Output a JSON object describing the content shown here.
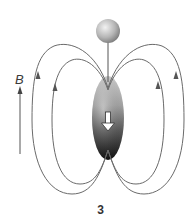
{
  "diagram": {
    "field_label": "B",
    "figure_number": "3",
    "elements": {
      "sphere": "charged-sphere",
      "stick": "rod",
      "ellipsoid": "magnetized-body",
      "moment_arrow": "downward-white-arrow",
      "field_lines": [
        "outer-left-loop",
        "inner-left-loop",
        "inner-right-loop",
        "outer-right-loop"
      ],
      "field_direction_arrow": "up"
    },
    "colors": {
      "line": "#6a6a6a",
      "sphere_light": "#e8e8e8",
      "sphere_dark": "#7a7a7a",
      "ellipsoid_light": "#d8d8d8",
      "ellipsoid_dark": "#1a1a1a"
    }
  }
}
